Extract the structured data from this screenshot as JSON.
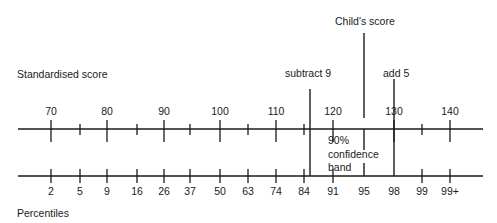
{
  "title": "Child's score",
  "labels": {
    "standardised_score": "Standardised score",
    "percentiles": "Percentiles",
    "subtract": "subtract 9",
    "add": "add 5",
    "band_line1": "90%",
    "band_line2": "confidence",
    "band_line3": "band"
  },
  "chart_data": {
    "type": "diagram",
    "title": "Child's score",
    "standardised_scale": {
      "label": "Standardised score",
      "ticks": [
        70,
        75,
        80,
        85,
        90,
        95,
        100,
        105,
        110,
        115,
        120,
        125,
        130,
        135,
        140
      ],
      "labeled_ticks": [
        70,
        80,
        90,
        100,
        110,
        120,
        130,
        140
      ]
    },
    "percentile_scale": {
      "label": "Percentiles",
      "labels": [
        "2",
        "5",
        "9",
        "16",
        "26",
        "37",
        "50",
        "63",
        "74",
        "84",
        "91",
        "95",
        "98",
        "99",
        "99+"
      ]
    },
    "child_score": 125,
    "confidence_band": {
      "level": "90%",
      "lower_offset": -9,
      "upper_offset": 5,
      "lower": 116,
      "upper": 130,
      "percentile_lower": "84",
      "percentile_upper": "98"
    }
  },
  "ticks_upper": [
    {
      "x": 51,
      "label": "70",
      "major": true
    },
    {
      "x": 80,
      "label": "",
      "major": false
    },
    {
      "x": 107,
      "label": "80",
      "major": true
    },
    {
      "x": 137,
      "label": "",
      "major": false
    },
    {
      "x": 164,
      "label": "90",
      "major": true
    },
    {
      "x": 190,
      "label": "",
      "major": false
    },
    {
      "x": 220,
      "label": "100",
      "major": true
    },
    {
      "x": 248,
      "label": "",
      "major": false
    },
    {
      "x": 276,
      "label": "110",
      "major": true
    },
    {
      "x": 304,
      "label": "",
      "major": false
    },
    {
      "x": 333,
      "label": "120",
      "major": true
    },
    {
      "x": 394,
      "label": "130",
      "major": true
    },
    {
      "x": 422,
      "label": "",
      "major": false
    },
    {
      "x": 450,
      "label": "140",
      "major": true
    }
  ],
  "ticks_lower": [
    {
      "x": 51,
      "label": "2"
    },
    {
      "x": 80,
      "label": "5"
    },
    {
      "x": 107,
      "label": "9"
    },
    {
      "x": 137,
      "label": "16"
    },
    {
      "x": 164,
      "label": "26"
    },
    {
      "x": 190,
      "label": "37"
    },
    {
      "x": 220,
      "label": "50"
    },
    {
      "x": 248,
      "label": "63"
    },
    {
      "x": 276,
      "label": "74"
    },
    {
      "x": 304,
      "label": "84"
    },
    {
      "x": 333,
      "label": "91"
    },
    {
      "x": 364,
      "label": "95"
    },
    {
      "x": 394,
      "label": "98"
    },
    {
      "x": 422,
      "label": "99"
    },
    {
      "x": 450,
      "label": "99+"
    }
  ],
  "colors": {
    "line": "#1a1a1a",
    "background": "#ffffff"
  }
}
